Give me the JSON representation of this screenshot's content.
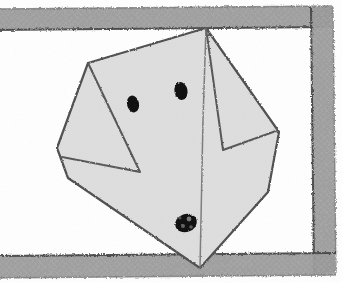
{
  "scene": {
    "title": "Hand-drawn pencil sketch of a dog's head in a partial frame",
    "medium": "pencil-sketch",
    "background_color": "#ffffff",
    "canvas": {
      "width": 342,
      "height": 283
    }
  },
  "cutoff_text": {
    "glyph": "t",
    "description": "partially cropped serif letter at the left edge",
    "color": "#1b1b1b",
    "x": 8,
    "y": 92
  },
  "frame": {
    "name": "hand-drawn-rectangular-border",
    "stroke_color": "#9a9a9a",
    "shade_color": "#8d8d8d",
    "edge_color": "#4a4a4a",
    "band_thickness": 20,
    "segments": [
      {
        "name": "top-border",
        "x1": 0,
        "y1": 18,
        "x2": 330,
        "y2": 14
      },
      {
        "name": "right-border",
        "x1": 315,
        "y1": 14,
        "x2": 318,
        "y2": 266
      },
      {
        "name": "bottom-border",
        "x1": 0,
        "y1": 266,
        "x2": 318,
        "y2": 264
      }
    ],
    "left_border_present": false
  },
  "dog": {
    "name": "polygon-dog-head",
    "fill_color": "#dedede",
    "outline_color": "#4f4f4f",
    "head_outline": "M 206,28 L 88,63 L 57,148 L 68,178 L 200,268 L 268,192 L 279,132 L 206,28 Z",
    "ear_left": {
      "name": "left-ear-fold",
      "path": "M 88,63 L 140,172 L 62,157",
      "label": "left floppy ear triangle"
    },
    "ear_right": {
      "name": "right-ear-fold",
      "path": "M 206,28 L 223,150 L 276,131",
      "label": "right floppy ear triangle"
    },
    "muzzle_fold": {
      "name": "muzzle-crease",
      "path": "M 206,28 L 200,268"
    },
    "eyes": [
      {
        "name": "eye-left",
        "cx": 133,
        "cy": 104,
        "rx": 6.0,
        "ry": 8.5,
        "rotation": -12,
        "color": "#0b0b0b"
      },
      {
        "name": "eye-right",
        "cx": 181,
        "cy": 91,
        "rx": 6.5,
        "ry": 9.0,
        "rotation": -10,
        "color": "#0b0b0b"
      }
    ],
    "nose": {
      "name": "nose-blob",
      "cx": 186,
      "cy": 223,
      "rx": 11,
      "ry": 9,
      "rotation": -18,
      "color": "#0d0d0d",
      "highlights": [
        {
          "cx": 189,
          "cy": 219,
          "r": 2.4
        },
        {
          "cx": 183,
          "cy": 226,
          "r": 2.0
        },
        {
          "cx": 191,
          "cy": 227,
          "r": 1.8
        },
        {
          "cx": 180,
          "cy": 218,
          "r": 1.6
        }
      ]
    }
  }
}
